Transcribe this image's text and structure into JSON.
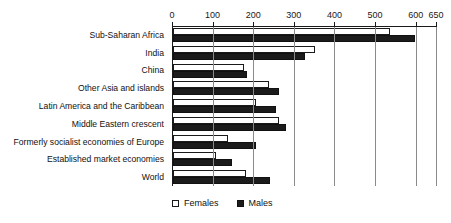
{
  "chart_data": {
    "type": "bar",
    "orientation": "horizontal",
    "title": "",
    "subtitle": "",
    "xlabel": "",
    "ylabel": "",
    "xlim": [
      0,
      650
    ],
    "grid": true,
    "grid_axis": "x",
    "legend_position": "bottom-left",
    "categories": [
      "Sub-Saharan Africa",
      "India",
      "China",
      "Other Asia and islands",
      "Latin America and the Caribbean",
      "Middle Eastern crescent",
      "Formerly socialist economies of Europe",
      "Established market economies",
      "World"
    ],
    "xticks": [
      0,
      100,
      200,
      300,
      400,
      500,
      600,
      650
    ],
    "xticklabels": [
      "0",
      "100",
      "200",
      "300",
      "400",
      "500",
      "600",
      "650"
    ],
    "series": [
      {
        "name": "Females",
        "color": "#ffffff",
        "edge_color": "#1a1a1a",
        "values": [
          535,
          350,
          175,
          237,
          205,
          262,
          135,
          105,
          180
        ]
      },
      {
        "name": "Males",
        "color": "#1b1b1b",
        "edge_color": "#111111",
        "values": [
          597,
          325,
          182,
          262,
          253,
          277,
          205,
          145,
          238
        ]
      }
    ]
  },
  "legend": {
    "items": [
      {
        "label": "Females",
        "swatch": "open-square-swatch"
      },
      {
        "label": "Males",
        "swatch": "filled-square-swatch"
      }
    ]
  }
}
